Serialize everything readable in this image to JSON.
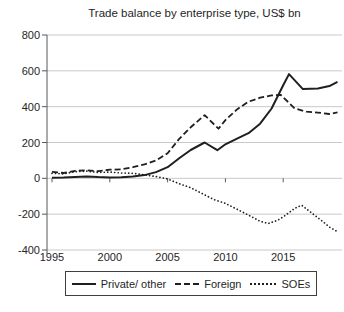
{
  "chart_data": {
    "type": "line",
    "title": "Trade balance by enterprise type, US$ bn",
    "xlabel": "",
    "ylabel": "",
    "x_ticks": [
      1995,
      2000,
      2005,
      2010,
      2015
    ],
    "y_ticks": [
      800,
      600,
      400,
      200,
      0,
      -200,
      -400
    ],
    "xlim": [
      1994.6,
      2020.1
    ],
    "ylim": [
      -400,
      800
    ],
    "grid": "horizontal",
    "legend_position": "bottom",
    "colors": {
      "line": "#1f1f1f",
      "grid": "#c9c9c9",
      "axis": "#595959",
      "text": "#262626",
      "background": "#ffffff"
    },
    "series": [
      {
        "name": "Private/ other",
        "key": "private-other",
        "style": "solid",
        "points": [
          [
            1995,
            3
          ],
          [
            1996,
            4
          ],
          [
            1997,
            8
          ],
          [
            1998,
            10
          ],
          [
            1999,
            7
          ],
          [
            2000,
            5
          ],
          [
            2001,
            6
          ],
          [
            2002,
            10
          ],
          [
            2003,
            18
          ],
          [
            2004,
            35
          ],
          [
            2005,
            62
          ],
          [
            2006,
            112
          ],
          [
            2007,
            158
          ],
          [
            2008.2,
            200
          ],
          [
            2009.3,
            157
          ],
          [
            2010,
            190
          ],
          [
            2011,
            222
          ],
          [
            2012,
            252
          ],
          [
            2013,
            305
          ],
          [
            2014,
            390
          ],
          [
            2015,
            520
          ],
          [
            2015.5,
            582
          ],
          [
            2016.7,
            498
          ],
          [
            2018,
            502
          ],
          [
            2019,
            515
          ],
          [
            2019.7,
            538
          ]
        ]
      },
      {
        "name": "Foreign",
        "key": "foreign",
        "style": "dashed",
        "points": [
          [
            1995,
            36
          ],
          [
            1996,
            30
          ],
          [
            1997,
            42
          ],
          [
            1998,
            45
          ],
          [
            1999,
            40
          ],
          [
            2000,
            48
          ],
          [
            2001,
            50
          ],
          [
            2002,
            62
          ],
          [
            2003,
            78
          ],
          [
            2004,
            100
          ],
          [
            2005,
            140
          ],
          [
            2006,
            220
          ],
          [
            2007,
            285
          ],
          [
            2008.2,
            353
          ],
          [
            2009.4,
            277
          ],
          [
            2010,
            325
          ],
          [
            2011,
            385
          ],
          [
            2012,
            428
          ],
          [
            2013,
            450
          ],
          [
            2014,
            463
          ],
          [
            2014.8,
            465
          ],
          [
            2016,
            390
          ],
          [
            2017,
            372
          ],
          [
            2018,
            367
          ],
          [
            2019,
            359
          ],
          [
            2019.7,
            368
          ]
        ]
      },
      {
        "name": "SOEs",
        "key": "soes",
        "style": "dotted",
        "points": [
          [
            1995,
            28
          ],
          [
            1996,
            25
          ],
          [
            1997,
            37
          ],
          [
            1998,
            40
          ],
          [
            1999,
            33
          ],
          [
            2000,
            35
          ],
          [
            2001,
            30
          ],
          [
            2002,
            28
          ],
          [
            2003,
            20
          ],
          [
            2004,
            10
          ],
          [
            2005,
            -3
          ],
          [
            2006,
            -30
          ],
          [
            2007,
            -52
          ],
          [
            2008,
            -85
          ],
          [
            2009,
            -118
          ],
          [
            2010,
            -140
          ],
          [
            2011,
            -172
          ],
          [
            2012,
            -205
          ],
          [
            2013,
            -240
          ],
          [
            2013.7,
            -252
          ],
          [
            2014.5,
            -235
          ],
          [
            2015,
            -215
          ],
          [
            2016,
            -167
          ],
          [
            2016.6,
            -150
          ],
          [
            2017.7,
            -205
          ],
          [
            2018.5,
            -245
          ],
          [
            2019,
            -272
          ],
          [
            2019.7,
            -298
          ]
        ]
      }
    ]
  }
}
